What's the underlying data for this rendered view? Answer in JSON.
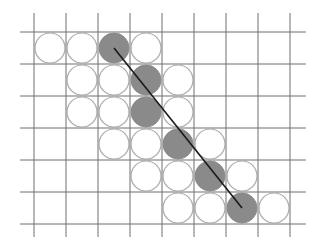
{
  "diagram": {
    "title": "",
    "colors": {
      "background": "#ffffff",
      "grid": "#6e6e6e",
      "circle_outline": "#a9a9a9",
      "circle_filled": "#8a8a8a",
      "line": "#1a1a1a"
    },
    "grid": {
      "cell_size": 32,
      "vertical_lines_x": [
        34,
        66,
        98,
        130,
        162,
        194,
        226,
        258,
        290
      ],
      "vertical_span_y": [
        13,
        237
      ],
      "horizontal_lines_y": [
        32,
        64,
        96,
        128,
        160,
        192,
        224
      ],
      "horizontal_span_x": [
        20,
        306
      ]
    },
    "origin": {
      "x": 34,
      "y": 32
    },
    "circle_radius": 15,
    "rows": [
      {
        "row": 0,
        "cells": [
          {
            "col": 0,
            "filled": false
          },
          {
            "col": 1,
            "filled": false
          },
          {
            "col": 2,
            "filled": true
          },
          {
            "col": 3,
            "filled": false
          }
        ]
      },
      {
        "row": 1,
        "cells": [
          {
            "col": 1,
            "filled": false
          },
          {
            "col": 2,
            "filled": false
          },
          {
            "col": 3,
            "filled": true
          },
          {
            "col": 4,
            "filled": false
          }
        ]
      },
      {
        "row": 2,
        "cells": [
          {
            "col": 1,
            "filled": false
          },
          {
            "col": 2,
            "filled": false
          },
          {
            "col": 3,
            "filled": true
          },
          {
            "col": 4,
            "filled": false
          }
        ]
      },
      {
        "row": 3,
        "cells": [
          {
            "col": 2,
            "filled": false
          },
          {
            "col": 3,
            "filled": false
          },
          {
            "col": 4,
            "filled": true
          },
          {
            "col": 5,
            "filled": false
          }
        ]
      },
      {
        "row": 4,
        "cells": [
          {
            "col": 3,
            "filled": false
          },
          {
            "col": 4,
            "filled": false
          },
          {
            "col": 5,
            "filled": true
          },
          {
            "col": 6,
            "filled": false
          }
        ]
      },
      {
        "row": 5,
        "cells": [
          {
            "col": 4,
            "filled": false
          },
          {
            "col": 5,
            "filled": false
          },
          {
            "col": 6,
            "filled": true
          },
          {
            "col": 7,
            "filled": false
          }
        ]
      }
    ],
    "line": {
      "from": {
        "col": 2,
        "row": 0
      },
      "to": {
        "col": 6,
        "row": 5
      }
    }
  }
}
